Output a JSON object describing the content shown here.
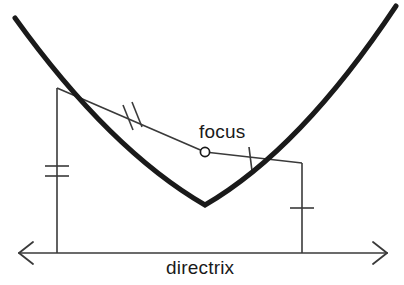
{
  "figure": {
    "type": "geometry-diagram",
    "background_color": "#ffffff",
    "curve_color": "#1a1a1a",
    "line_color": "#3a3a3a",
    "text_color": "#1a1a1a"
  },
  "labels": {
    "focus": "focus",
    "directrix": "directrix"
  },
  "geometry": {
    "parabola": {
      "vertex": [
        205,
        205
      ],
      "left_end": [
        15,
        18
      ],
      "right_end": [
        396,
        6
      ],
      "stroke_width": 5
    },
    "directrix": {
      "y": 253,
      "x_start": 18,
      "x_end": 388,
      "arrowheads": [
        "left",
        "right"
      ],
      "stroke_width": 1.6
    },
    "focus_point": {
      "center": [
        205,
        152
      ],
      "radius": 4.6,
      "fill": "#ffffff",
      "stroke": "#1a1a1a"
    },
    "point_p1": {
      "on_curve": [
        57,
        88
      ],
      "foot_on_directrix": [
        57,
        253
      ],
      "drop_ticks": 2
    },
    "point_p2": {
      "on_curve": [
        302,
        163
      ],
      "foot_on_directrix": [
        302,
        253
      ],
      "drop_ticks": 1
    },
    "segment_p1_focus": {
      "from": [
        57,
        88
      ],
      "to": [
        205,
        152
      ],
      "ticks": 2
    },
    "segment_focus_p2": {
      "from": [
        205,
        152
      ],
      "to": [
        302,
        163
      ],
      "ticks": 1
    }
  }
}
